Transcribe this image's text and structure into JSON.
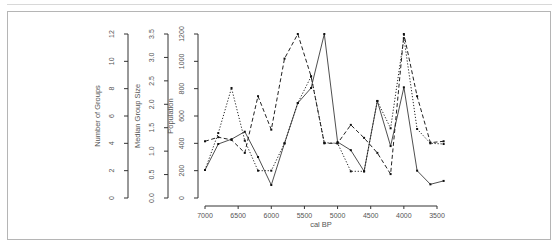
{
  "chart_data": {
    "type": "line",
    "title": "",
    "xlabel": "cal BP",
    "x_ticks": [
      7000,
      6500,
      6000,
      5500,
      5000,
      4500,
      4000,
      3500
    ],
    "xlim": [
      7000,
      3400
    ],
    "x_reversed": true,
    "y_axes": [
      {
        "label": "Number of Groups",
        "ticks": [
          0,
          2,
          4,
          6,
          8,
          10,
          12
        ],
        "range": [
          0,
          12
        ]
      },
      {
        "label": "Median Group Size",
        "ticks": [
          "0.0",
          "0.5",
          "1.0",
          "1.5",
          "2.0",
          "2.5",
          "3.0",
          "3.5"
        ],
        "range": [
          0,
          3.5
        ]
      },
      {
        "label": "Population",
        "ticks": [
          0,
          200,
          400,
          600,
          800,
          1000,
          1200
        ],
        "range": [
          0,
          1200
        ]
      }
    ],
    "x": [
      7000,
      6800,
      6600,
      6400,
      6200,
      6000,
      5800,
      5600,
      5400,
      5200,
      5000,
      4800,
      4600,
      4400,
      4200,
      4000,
      3800,
      3600,
      3400
    ],
    "series": [
      {
        "name": "Population (solid)",
        "style": "solid",
        "values": [
          205,
          395,
          430,
          485,
          300,
          95,
          400,
          695,
          805,
          1200,
          410,
          350,
          195,
          710,
          380,
          810,
          200,
          100,
          125
        ]
      },
      {
        "name": "Median Group Size (dotted)",
        "style": "dotted",
        "values": [
          205,
          475,
          805,
          420,
          200,
          200,
          400,
          695,
          890,
          405,
          400,
          195,
          195,
          710,
          510,
          1170,
          505,
          400,
          395
        ]
      },
      {
        "name": "Number of Groups (dashed)",
        "style": "dashed",
        "values": [
          415,
          445,
          425,
          330,
          745,
          500,
          1020,
          1200,
          890,
          400,
          400,
          535,
          440,
          330,
          175,
          1200,
          745,
          405,
          415
        ]
      }
    ],
    "grid": false,
    "legend": "none"
  }
}
